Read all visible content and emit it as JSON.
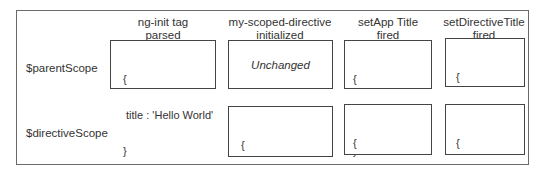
{
  "columns": [
    {
      "line1": "ng-init tag",
      "line2": "parsed"
    },
    {
      "line1": "my-scoped-directive",
      "line2": "initialized"
    },
    {
      "line1": "setApp Title",
      "line2": "fired"
    },
    {
      "line1": "setDirectiveTitle",
      "line2": "fired"
    }
  ],
  "rows": [
    {
      "label": "$parentScope",
      "cells": [
        {
          "open": "{",
          "body": " title : 'Hello World'",
          "close": "}"
        },
        {
          "text": "Unchanged"
        },
        {
          "open": "{",
          "body": " title : 'App 2.0'",
          "close": "}"
        },
        {
          "open": "{",
          "body": " title : 'bob'",
          "close": "}"
        }
      ]
    },
    {
      "label": "$directiveScope",
      "cells": [
        {},
        {
          "open": "{",
          "body": " title : 'Hello World'",
          "close": "}"
        },
        {
          "open": "{",
          "body": " title : 'App 2.0'",
          "close": "}"
        },
        {
          "open": "{",
          "body": " title : 'bob'",
          "close": "}"
        }
      ]
    }
  ]
}
